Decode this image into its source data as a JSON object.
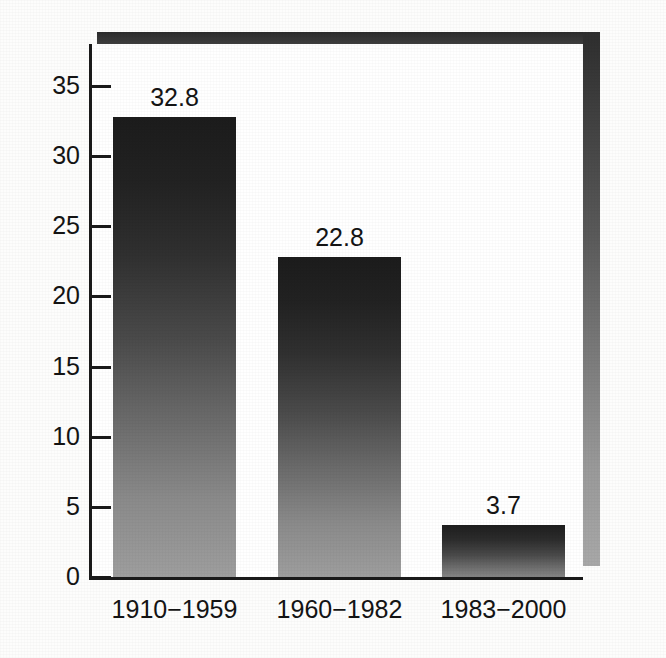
{
  "chart_data": {
    "type": "bar",
    "title": "",
    "subtitle": "",
    "xlabel": "",
    "ylabel": "",
    "categories": [
      "1910−1959",
      "1960−1982",
      "1983−2000"
    ],
    "values": [
      32.8,
      22.8,
      3.7
    ],
    "value_labels": [
      "32.8",
      "22.8",
      "3.7"
    ],
    "series": [
      {
        "name": "",
        "values": [
          32.8,
          22.8,
          3.7
        ]
      }
    ],
    "ylim": [
      0,
      38
    ],
    "yticks": [
      0,
      5,
      10,
      15,
      20,
      25,
      30,
      35
    ],
    "ytick_labels": [
      "0",
      "5",
      "10",
      "15",
      "20",
      "25",
      "30",
      "35"
    ],
    "grid": false,
    "legend": false,
    "legend_position": "none",
    "tick_direction": "in",
    "axis_style": "left-and-bottom-spines",
    "bar_fill": "vertical-gradient-dark-to-gray",
    "colors": {
      "bar_top": "#1c1c1c",
      "bar_bottom": "#9e9e9e",
      "axis": "#1a1a1a",
      "text": "#141414",
      "plot_background": "#ffffff",
      "figure_background": "#fdfdfc",
      "shadow_dark": "#2b2b2b",
      "shadow_light": "#a8a8a8"
    }
  },
  "figure": {
    "decorations": {
      "shadow_top_name": "top-shadow-band",
      "shadow_right_name": "right-shadow-band"
    }
  }
}
